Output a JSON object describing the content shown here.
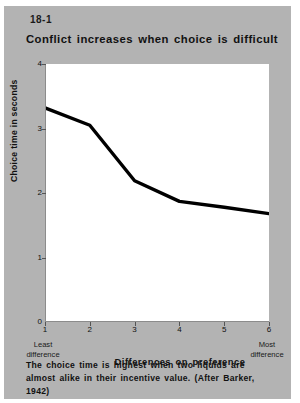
{
  "figure": {
    "number": "18-1",
    "title": "Conflict increases when choice is difficult",
    "caption": "The choice time is highest when two liquids are almost alike in their incentive value. (After Barker, 1942)",
    "background_color": "#b3b3b3",
    "plot_background_color": "#ffffff",
    "line_color": "#000000"
  },
  "chart_data": {
    "type": "line",
    "title": "Conflict increases when choice is difficult",
    "xlabel": "Differences on preference",
    "ylabel": "Choice time in seconds",
    "x": [
      1,
      2,
      3,
      4,
      5,
      6
    ],
    "values": [
      3.32,
      3.05,
      2.19,
      1.87,
      1.78,
      1.68
    ],
    "xtick_labels": [
      "1",
      "2",
      "3",
      "4",
      "5",
      "6"
    ],
    "ytick_labels": [
      "0",
      "1",
      "2",
      "3",
      "4"
    ],
    "ytick_values": [
      0,
      1,
      2,
      3,
      4
    ],
    "xlim": [
      1,
      6
    ],
    "ylim": [
      0,
      4
    ],
    "grid": false,
    "legend": false,
    "axis_end_labels": {
      "left_line1": "Least",
      "left_line2": "difference",
      "right_line1": "Most",
      "right_line2": "difference"
    }
  }
}
